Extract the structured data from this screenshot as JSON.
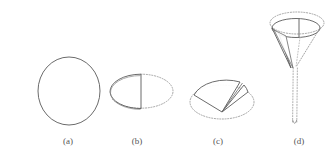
{
  "figure": {
    "background_color": "#ffffff",
    "stroke_color": "#555555",
    "dotted_color": "#9a9a9a",
    "label_color": "#555555",
    "caption_color": "#b9b9b9",
    "width": 334,
    "height": 166,
    "panels": [
      {
        "id": "a",
        "label": "(a)",
        "label_x": 68,
        "label_y": 141,
        "description": "circle outline",
        "shape": "circle",
        "center_x": 69,
        "center_y": 91,
        "radius_x": 31,
        "radius_y": 34
      },
      {
        "id": "b",
        "label": "(b)",
        "label_x": 137,
        "label_y": 141,
        "description": "half disc folded upright over dotted ellipse",
        "shape": "half-disc-fold",
        "center_x": 141,
        "center_y": 91,
        "radius_x": 32,
        "radius_y": 17,
        "chord_x": 141,
        "chord_top_y": 74,
        "chord_bottom_y": 108
      },
      {
        "id": "c",
        "label": "(c)",
        "label_x": 218,
        "label_y": 141,
        "description": "sector wedge lifted above dotted ellipse",
        "shape": "sector-lift",
        "center_x": 222,
        "center_y": 102,
        "radius_x": 32,
        "radius_y": 17
      },
      {
        "id": "d",
        "label": "(d)",
        "label_x": 299,
        "label_y": 141,
        "description": "cone funnel with dotted rim and long tail",
        "shape": "cone-funnel",
        "center_x": 297,
        "center_y": 26,
        "outer_radius_x": 27,
        "outer_radius_y": 11,
        "inner_radius_x": 24,
        "inner_radius_y": 9,
        "apex_x": 294,
        "apex_y": 68,
        "tail_bottom_y": 125
      }
    ],
    "caption": "",
    "caption_visible": false
  }
}
